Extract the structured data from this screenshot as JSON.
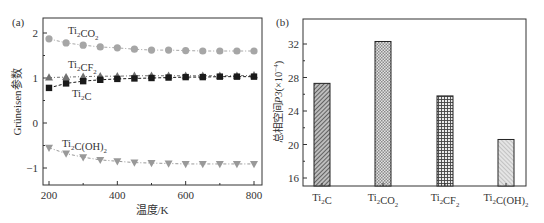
{
  "chart_data": [
    {
      "panel_label": "(a)",
      "type": "line",
      "title": "",
      "xlabel": "温度/K",
      "ylabel": "Grüneisen参数",
      "xlim": [
        185,
        820
      ],
      "ylim": [
        -1.4,
        2.33
      ],
      "xticks": [
        200,
        400,
        600,
        800
      ],
      "xminor": [
        300,
        500,
        700
      ],
      "yticks": [
        2,
        1,
        0,
        -1
      ],
      "grid": false,
      "x": [
        200,
        250,
        300,
        350,
        400,
        450,
        500,
        550,
        600,
        650,
        700,
        750,
        800
      ],
      "series": [
        {
          "name": "Ti2CO2",
          "label_main": "Ti",
          "label_sub1": "2",
          "label_mid": "CO",
          "label_sub2": "2",
          "label_tail": "",
          "marker": "circle",
          "color": "#a6a6a6",
          "values": [
            1.87,
            1.78,
            1.73,
            1.69,
            1.67,
            1.64,
            1.62,
            1.62,
            1.61,
            1.6,
            1.6,
            1.6,
            1.6
          ]
        },
        {
          "name": "Ti2CF2",
          "label_main": "Ti",
          "label_sub1": "2",
          "label_mid": "CF",
          "label_sub2": "2",
          "label_tail": "",
          "marker": "triangle-up",
          "color": "#707070",
          "values": [
            1.01,
            1.02,
            1.03,
            1.04,
            1.04,
            1.05,
            1.05,
            1.05,
            1.05,
            1.05,
            1.05,
            1.05,
            1.06
          ]
        },
        {
          "name": "Ti2C",
          "label_main": "Ti",
          "label_sub1": "2",
          "label_mid": "C",
          "label_sub2": "",
          "label_tail": "",
          "marker": "square",
          "color": "#1a1a1a",
          "values": [
            0.78,
            0.88,
            0.93,
            0.96,
            0.98,
            0.99,
            1.0,
            1.01,
            1.02,
            1.02,
            1.03,
            1.03,
            1.03
          ]
        },
        {
          "name": "Ti2C(OH)2",
          "label_main": "Ti",
          "label_sub1": "2",
          "label_mid": "C(OH)",
          "label_sub2": "2",
          "label_tail": "",
          "marker": "triangle-down",
          "color": "#999999",
          "values": [
            -0.55,
            -0.68,
            -0.76,
            -0.82,
            -0.85,
            -0.88,
            -0.89,
            -0.9,
            -0.91,
            -0.91,
            -0.91,
            -0.91,
            -0.91
          ]
        }
      ]
    },
    {
      "panel_label": "(b)",
      "type": "bar",
      "title": "",
      "xlabel": "",
      "ylabel": "总相空间P3(×10⁻⁴)",
      "ylabel_main": "总相空间",
      "ylabel_var": "P3",
      "ylabel_unit": "(×10",
      "ylabel_exp": "−4",
      "ylabel_close": ")",
      "ylim": [
        15,
        35
      ],
      "yticks": [
        32,
        28,
        24,
        20,
        16
      ],
      "grid": false,
      "categories": [
        "Ti2C",
        "Ti2CO2",
        "Ti2CF2",
        "Ti2C(OH)2"
      ],
      "category_labels": [
        {
          "main": "Ti",
          "sub1": "2",
          "mid": "C",
          "sub2": ""
        },
        {
          "main": "Ti",
          "sub1": "2",
          "mid": "CO",
          "sub2": "2"
        },
        {
          "main": "Ti",
          "sub1": "2",
          "mid": "CF",
          "sub2": "2"
        },
        {
          "main": "Ti",
          "sub1": "2",
          "mid": "C(OH)",
          "sub2": "2"
        }
      ],
      "values": [
        27.3,
        32.3,
        25.8,
        20.6
      ],
      "patterns": [
        "diagonal-dense",
        "crosshatch-fine",
        "grid",
        "diagonal-light"
      ]
    }
  ]
}
